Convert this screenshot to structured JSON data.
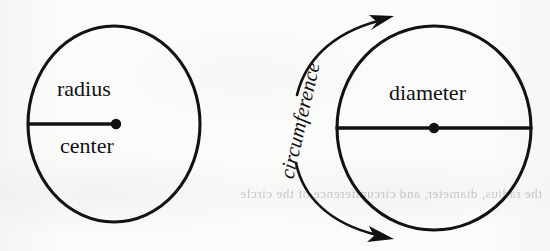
{
  "figure": {
    "kind": "geometry-diagram",
    "background_color": "#fbfbfa",
    "ink_color": "#121212",
    "showthrough_text": "the radius, diameter, and circumference of the circle"
  },
  "left_circle": {
    "name": "radius-circle",
    "center": {
      "x": 114,
      "y": 124
    },
    "rx": 86,
    "ry": 98,
    "stroke_width": 3,
    "center_dot_radius": 5,
    "radius_line": {
      "x1": 28,
      "y1": 124,
      "x2": 114,
      "y2": 124
    },
    "labels": {
      "radius": "radius",
      "center": "center"
    }
  },
  "right_circle": {
    "name": "diameter-circle",
    "center": {
      "x": 434,
      "y": 128
    },
    "rx": 97,
    "ry": 102,
    "stroke_width": 3,
    "center_dot_radius": 5,
    "diameter_line": {
      "x1": 337,
      "y1": 128,
      "x2": 531,
      "y2": 128
    },
    "labels": {
      "diameter": "diameter"
    }
  },
  "circumference_annotation": {
    "label": "circumference",
    "rotation_deg": -77,
    "arrows": [
      {
        "name": "upper-arc-arrow",
        "direction": "northeast",
        "tip": {
          "x": 392,
          "y": 17
        }
      },
      {
        "name": "lower-arc-arrow",
        "direction": "southeast",
        "tip": {
          "x": 392,
          "y": 238
        }
      }
    ]
  }
}
